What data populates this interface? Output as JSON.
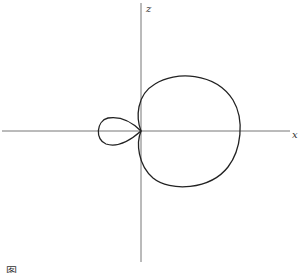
{
  "figure": {
    "axis_labels": {
      "horizontal": "x",
      "vertical": "z"
    },
    "caption": "图"
  }
}
